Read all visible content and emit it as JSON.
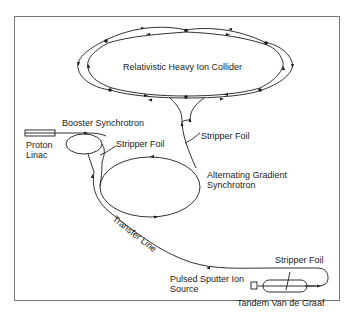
{
  "diagram": {
    "type": "accelerator-complex-schematic",
    "labels": {
      "rhic": "Relativistic Heavy Ion Collider",
      "booster": "Booster Synchrotron",
      "proton_linac_line1": "Proton",
      "proton_linac_line2": "Linac",
      "stripper_foil_booster": "Stripper Foil",
      "stripper_foil_rhic": "Stripper Foil",
      "ags_line1": "Alternating Gradient",
      "ags_line2": "Synchrotron",
      "transfer_line": "Transfer Line",
      "stripper_foil_tandem": "Stripper Foil",
      "ion_source_line1": "Pulsed Sputter Ion",
      "ion_source_line2": "Source",
      "tandem": "Tandem Van de Graaf"
    },
    "nodes": [
      {
        "id": "rhic",
        "label": "Relativistic Heavy Ion Collider",
        "shape": "double ring with 6 intersection points"
      },
      {
        "id": "booster",
        "label": "Booster Synchrotron",
        "shape": "small ellipse"
      },
      {
        "id": "proton_linac",
        "label": "Proton Linac",
        "shape": "rectangle"
      },
      {
        "id": "ags",
        "label": "Alternating Gradient Synchrotron",
        "shape": "ellipse"
      },
      {
        "id": "ion_source",
        "label": "Pulsed Sputter Ion Source",
        "shape": "small square"
      },
      {
        "id": "tandem",
        "label": "Tandem Van de Graaf",
        "shape": "capsule"
      }
    ],
    "edges": [
      {
        "from": "ion_source",
        "to": "tandem"
      },
      {
        "from": "tandem",
        "to": "booster",
        "via": "Transfer Line"
      },
      {
        "from": "proton_linac",
        "to": "booster"
      },
      {
        "from": "booster",
        "to": "ags",
        "via": "Stripper Foil"
      },
      {
        "from": "ags",
        "to": "rhic",
        "via": "Stripper Foil"
      }
    ],
    "colors": {
      "line": "#1a1a1a",
      "frame": "#777777",
      "background": "#ffffff"
    }
  }
}
